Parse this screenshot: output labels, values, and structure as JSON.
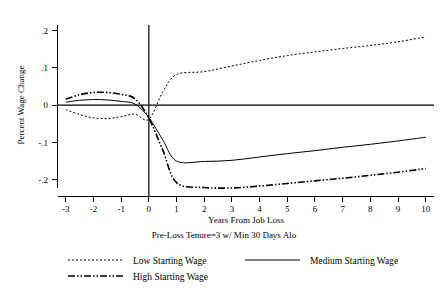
{
  "figure": {
    "ylabel": "Percent Wage Change",
    "xlabel": "Years From Job Loss",
    "subtitle": "Pre-Loss Tenure=3 w/ Min 30 Days Alo",
    "background_color": "#ffffff",
    "line_color": "#000000"
  },
  "legend": {
    "entries": [
      {
        "label": "Low Starting Wage",
        "style": "dotted",
        "swatch": "low-wage-swatch"
      },
      {
        "label": "Medium Starting Wage",
        "style": "solid",
        "swatch": "medium-wage-swatch"
      },
      {
        "label": "High Starting Wage",
        "style": "dash-dot-dot",
        "swatch": "high-wage-swatch"
      }
    ]
  },
  "chart_data": {
    "type": "line",
    "title": "",
    "subtitle": "Pre-Loss Tenure=3 w/ Min 30 Days Alo",
    "xlabel": "Years From Job Loss",
    "ylabel": "Percent Wage Change",
    "xlim": [
      -3.3,
      10.3
    ],
    "ylim": [
      -0.245,
      0.215
    ],
    "xticks": [
      -3,
      -2,
      -1,
      0,
      1,
      2,
      3,
      4,
      5,
      6,
      7,
      8,
      9,
      10
    ],
    "xticklabels": [
      "-3",
      "-2",
      "-1",
      "0",
      "1",
      "2",
      "3",
      "4",
      "5",
      "6",
      "7",
      "8",
      "9",
      "10"
    ],
    "yticks": [
      0.2,
      0.1,
      0,
      -0.1,
      -0.2
    ],
    "yticklabels": [
      ".2",
      ".1",
      "0",
      "-.1",
      "-.2"
    ],
    "grid": false,
    "legend_position": "below",
    "reference_lines": [
      {
        "name": "zero-horizontal",
        "orientation": "horizontal",
        "value": 0
      },
      {
        "name": "job-loss-vertical",
        "orientation": "vertical",
        "value": 0
      }
    ],
    "x": [
      -3,
      -2.5,
      -2,
      -1.5,
      -1,
      -0.5,
      0,
      0.5,
      1,
      2,
      3,
      4,
      5,
      6,
      7,
      8,
      9,
      10
    ],
    "series": [
      {
        "name": "Low Starting Wage",
        "style": "dotted",
        "values": [
          -0.012,
          -0.025,
          -0.034,
          -0.036,
          -0.031,
          -0.024,
          -0.038,
          0.035,
          0.082,
          0.09,
          0.105,
          0.12,
          0.133,
          0.143,
          0.152,
          0.16,
          0.17,
          0.183
        ]
      },
      {
        "name": "Medium Starting Wage",
        "style": "solid",
        "values": [
          0.008,
          0.013,
          0.015,
          0.014,
          0.01,
          0.003,
          -0.033,
          -0.093,
          -0.15,
          -0.151,
          -0.148,
          -0.139,
          -0.13,
          -0.122,
          -0.113,
          -0.105,
          -0.096,
          -0.086
        ]
      },
      {
        "name": "High Starting Wage",
        "style": "dash-dot-dot",
        "values": [
          0.016,
          0.028,
          0.034,
          0.034,
          0.029,
          0.017,
          -0.035,
          -0.12,
          -0.208,
          -0.221,
          -0.222,
          -0.217,
          -0.21,
          -0.203,
          -0.196,
          -0.188,
          -0.18,
          -0.17
        ]
      }
    ]
  }
}
